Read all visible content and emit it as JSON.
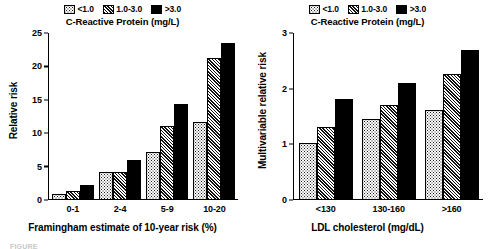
{
  "legend": {
    "entries": [
      {
        "label": "<1.0",
        "pattern": "dots"
      },
      {
        "label": "1.0-3.0",
        "pattern": "hatch"
      },
      {
        "label": ">3.0",
        "pattern": "solid"
      }
    ]
  },
  "caption": {
    "text": "FIGURE"
  },
  "chart_data": [
    {
      "type": "bar",
      "title": "C-Reactive Protein (mg/L)",
      "xlabel": "Framingham estimate of 10-year risk (%)",
      "ylabel": "Relative risk",
      "categories": [
        "0-1",
        "2-4",
        "5-9",
        "10-20"
      ],
      "ylim": [
        0,
        25
      ],
      "yticks": [
        0,
        5,
        10,
        15,
        20,
        25
      ],
      "grid": false,
      "legend_position": "top-center",
      "series": [
        {
          "name": "<1.0",
          "pattern": "dots",
          "values": [
            0.7,
            4.0,
            7.0,
            11.5
          ]
        },
        {
          "name": "1.0-3.0",
          "pattern": "hatch",
          "values": [
            1.1,
            4.0,
            11.0,
            21.3
          ]
        },
        {
          "name": ">3.0",
          "pattern": "solid",
          "values": [
            2.1,
            5.9,
            14.3,
            23.5
          ]
        }
      ]
    },
    {
      "type": "bar",
      "title": "C-Reactive Protein (mg/L)",
      "xlabel": "LDL cholesterol (mg/dL)",
      "ylabel": "Multivariable relative risk",
      "categories": [
        "<130",
        "130-160",
        ">160"
      ],
      "ylim": [
        0,
        3
      ],
      "yticks": [
        0,
        1,
        2,
        3
      ],
      "grid": false,
      "legend_position": "top-center",
      "series": [
        {
          "name": "<1.0",
          "pattern": "dots",
          "values": [
            1.0,
            1.45,
            1.6
          ]
        },
        {
          "name": "1.0-3.0",
          "pattern": "hatch",
          "values": [
            1.3,
            1.7,
            2.25
          ]
        },
        {
          "name": ">3.0",
          "pattern": "solid",
          "values": [
            1.8,
            2.1,
            2.7
          ]
        }
      ]
    }
  ]
}
